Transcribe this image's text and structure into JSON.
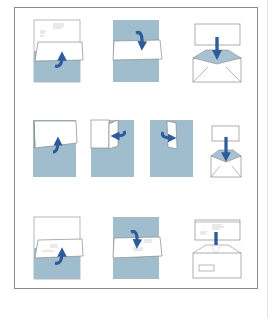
{
  "diagram": {
    "title": "Letter folding and envelope insertion instructions",
    "colors": {
      "paper_blue": "#9fbdcc",
      "arrow_blue": "#2e5c9a",
      "outline": "#8a8a8a",
      "envelope_flap": "#a7c3d1"
    },
    "rows": [
      {
        "steps": [
          {
            "name": "fold-bottom-third-up",
            "description": "Fold bottom third up over letter"
          },
          {
            "name": "fold-top-third-down",
            "description": "Fold top third down"
          },
          {
            "name": "insert-into-envelope",
            "description": "Insert folded letter into envelope"
          }
        ]
      },
      {
        "steps": [
          {
            "name": "fold-bottom-half-up",
            "description": "Fold bottom half up"
          },
          {
            "name": "fold-right-side-left",
            "description": "Fold right side to the left"
          },
          {
            "name": "fold-left-side-right",
            "description": "Fold left side to the right"
          },
          {
            "name": "insert-into-small-envelope",
            "description": "Insert into small envelope"
          }
        ]
      },
      {
        "steps": [
          {
            "name": "fold-bottom-third-up-address",
            "description": "Fold bottom third up with address showing"
          },
          {
            "name": "fold-top-third-down-address",
            "description": "Fold top third down"
          },
          {
            "name": "insert-into-window-envelope",
            "description": "Insert into window envelope"
          }
        ]
      }
    ]
  }
}
